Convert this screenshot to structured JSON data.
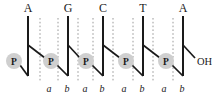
{
  "figure": {
    "name": "dna-backbone-diagram",
    "type": "schematic",
    "width": 212,
    "height": 96,
    "background_color": "#ffffff",
    "ink_color": "#1a1a1a",
    "guide_color": "#9a9a9a",
    "phosphate_fill": "#cfcfcf"
  },
  "bases": [
    {
      "label": "A",
      "x": 28
    },
    {
      "label": "G",
      "x": 68
    },
    {
      "label": "C",
      "x": 103
    },
    {
      "label": "T",
      "x": 143
    },
    {
      "label": "A",
      "x": 183
    }
  ],
  "backbones": [
    {
      "x": 28,
      "top_y": 16,
      "bottom_y": 76
    },
    {
      "x": 68,
      "top_y": 16,
      "bottom_y": 76
    },
    {
      "x": 103,
      "top_y": 16,
      "bottom_y": 76
    },
    {
      "x": 143,
      "top_y": 16,
      "bottom_y": 76
    },
    {
      "x": 183,
      "top_y": 16,
      "bottom_y": 76
    }
  ],
  "phosphates": [
    {
      "label": "P",
      "cx": 14,
      "cy": 61,
      "r": 8
    },
    {
      "label": "P",
      "cx": 51,
      "cy": 61,
      "r": 8
    },
    {
      "label": "P",
      "cx": 86,
      "cy": 61,
      "r": 8
    },
    {
      "label": "P",
      "cx": 126,
      "cy": 61,
      "r": 8
    },
    {
      "label": "P",
      "cx": 166,
      "cy": 61,
      "r": 8
    }
  ],
  "branch_bonds": [
    {
      "from_x": 28,
      "from_y": 45,
      "to_x": 45,
      "to_y": 58
    },
    {
      "from_x": 68,
      "from_y": 45,
      "to_x": 80,
      "to_y": 58
    },
    {
      "from_x": 103,
      "from_y": 45,
      "to_x": 120,
      "to_y": 58
    },
    {
      "from_x": 143,
      "from_y": 45,
      "to_x": 160,
      "to_y": 58
    },
    {
      "from_x": 183,
      "from_y": 45,
      "to_x": 195,
      "to_y": 58
    }
  ],
  "linker_bonds": [
    {
      "from_x": 20,
      "from_y": 65,
      "to_x": 28,
      "to_y": 76
    },
    {
      "from_x": 57,
      "from_y": 65,
      "to_x": 68,
      "to_y": 76
    },
    {
      "from_x": 92,
      "from_y": 65,
      "to_x": 103,
      "to_y": 76
    },
    {
      "from_x": 132,
      "from_y": 65,
      "to_x": 143,
      "to_y": 76
    },
    {
      "from_x": 172,
      "from_y": 65,
      "to_x": 183,
      "to_y": 76
    }
  ],
  "guides": [
    {
      "x": 40,
      "top_y": 18,
      "bottom_y": 82
    },
    {
      "x": 58,
      "top_y": 18,
      "bottom_y": 82
    },
    {
      "x": 78,
      "top_y": 18,
      "bottom_y": 82
    },
    {
      "x": 93,
      "top_y": 18,
      "bottom_y": 82
    },
    {
      "x": 113,
      "top_y": 18,
      "bottom_y": 82
    },
    {
      "x": 133,
      "top_y": 18,
      "bottom_y": 82
    },
    {
      "x": 153,
      "top_y": 18,
      "bottom_y": 82
    },
    {
      "x": 173,
      "top_y": 18,
      "bottom_y": 82
    }
  ],
  "site_labels": [
    {
      "label": "a",
      "x": 49
    },
    {
      "label": "b",
      "x": 67
    },
    {
      "label": "a",
      "x": 85
    },
    {
      "label": "b",
      "x": 102
    },
    {
      "label": "a",
      "x": 124
    },
    {
      "label": "b",
      "x": 142
    },
    {
      "label": "a",
      "x": 164
    },
    {
      "label": "b",
      "x": 182
    }
  ],
  "site_labels_y": 92,
  "terminus": {
    "label": "OH",
    "x": 197,
    "y": 65
  },
  "base_label_y": 12
}
